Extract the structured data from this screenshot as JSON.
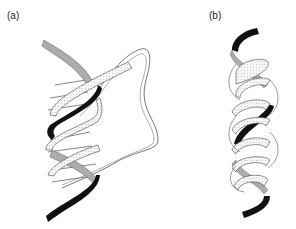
{
  "figure": {
    "panels": [
      {
        "label": "(a)",
        "description": "double helix with one strand forming a large loop"
      },
      {
        "label": "(b)",
        "description": "triple-stranded helix"
      }
    ]
  },
  "colors": {
    "dark_strand": "#111111",
    "gray_strand": "#a8a8a8",
    "light_strand": "#f4f4f4",
    "outline": "#444444"
  }
}
